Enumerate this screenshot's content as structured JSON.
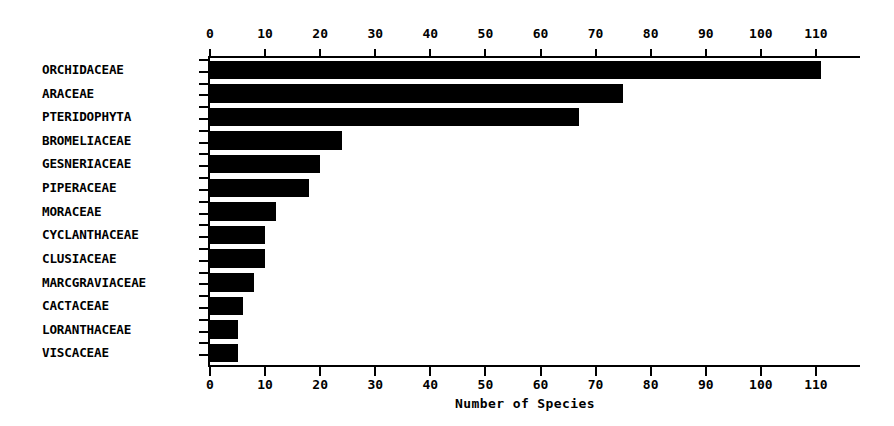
{
  "chart_data": {
    "type": "bar",
    "orientation": "horizontal",
    "title": "",
    "subtitle": "",
    "xlabel": "Number of Species",
    "ylabel": "",
    "xlim": [
      0,
      118
    ],
    "grid": false,
    "legend": null,
    "axis_position": "both-top-and-bottom",
    "tick_labels": [
      "0",
      "10",
      "20",
      "30",
      "40",
      "50",
      "60",
      "70",
      "80",
      "90",
      "100",
      "110"
    ],
    "tick_values": [
      0,
      10,
      20,
      30,
      40,
      50,
      60,
      70,
      80,
      90,
      100,
      110
    ],
    "categories": [
      "ORCHIDACEAE",
      "ARACEAE",
      "PTERIDOPHYTA",
      "BROMELIACEAE",
      "GESNERIACEAE",
      "PIPERACEAE",
      "MORACEAE",
      "CYCLANTHACEAE",
      "CLUSIACEAE",
      "MARCGRAVIACEAE",
      "CACTACEAE",
      "LORANTHACEAE",
      "VISCACEAE"
    ],
    "values": [
      111,
      75,
      67,
      24,
      20,
      18,
      12,
      10,
      10,
      8,
      6,
      5,
      5
    ],
    "bar_color": "#000000",
    "background_color": "#ffffff"
  }
}
